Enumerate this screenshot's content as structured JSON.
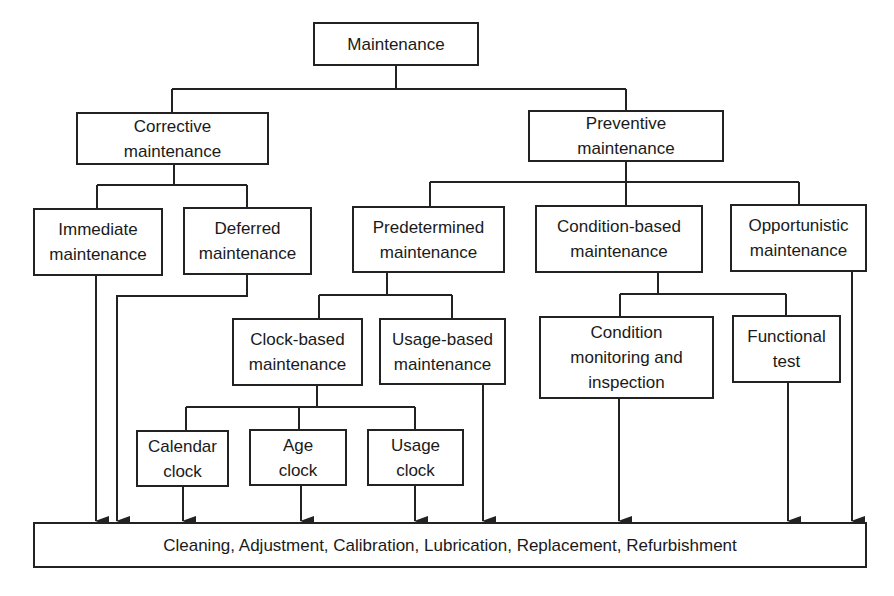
{
  "diagram": {
    "type": "hierarchy",
    "root": {
      "line1": "Maintenance"
    },
    "corrective": {
      "line1": "Corrective",
      "line2": "maintenance"
    },
    "preventive": {
      "line1": "Preventive",
      "line2": "maintenance"
    },
    "immediate": {
      "line1": "Immediate",
      "line2": "maintenance"
    },
    "deferred": {
      "line1": "Deferred",
      "line2": "maintenance"
    },
    "predetermined": {
      "line1": "Predetermined",
      "line2": "maintenance"
    },
    "condition_based": {
      "line1": "Condition-based",
      "line2": "maintenance"
    },
    "opportunistic": {
      "line1": "Opportunistic",
      "line2": "maintenance"
    },
    "clock_based": {
      "line1": "Clock-based",
      "line2": "maintenance"
    },
    "usage_based": {
      "line1": "Usage-based",
      "line2": "maintenance"
    },
    "condition_monitoring": {
      "line1": "Condition",
      "line2": "monitoring and",
      "line3": "inspection"
    },
    "functional_test": {
      "line1": "Functional",
      "line2": "test"
    },
    "calendar_clock": {
      "line1": "Calendar",
      "line2": "clock"
    },
    "age_clock": {
      "line1": "Age",
      "line2": "clock"
    },
    "usage_clock": {
      "line1": "Usage",
      "line2": "clock"
    },
    "actions": {
      "line1": "Cleaning, Adjustment, Calibration, Lubrication, Replacement, Refurbishment"
    }
  },
  "colors": {
    "line": "#222222",
    "background": "#ffffff"
  }
}
